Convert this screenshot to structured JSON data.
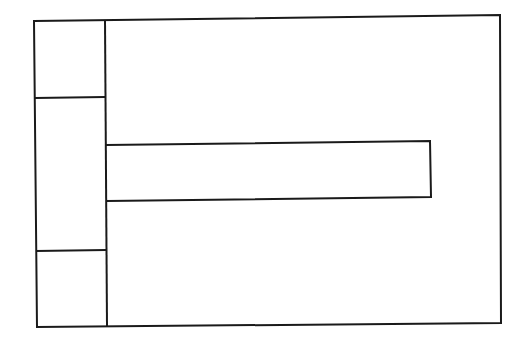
{
  "diagram": {
    "type": "wireframe-layout",
    "stroke_color": "#1a1a1a",
    "background": "#ffffff",
    "regions": [
      {
        "id": "outer-frame",
        "label": ""
      },
      {
        "id": "left-column-top",
        "label": ""
      },
      {
        "id": "left-column-middle",
        "label": ""
      },
      {
        "id": "left-column-bottom",
        "label": ""
      },
      {
        "id": "main-area",
        "label": ""
      },
      {
        "id": "horizontal-bar",
        "label": ""
      }
    ]
  }
}
